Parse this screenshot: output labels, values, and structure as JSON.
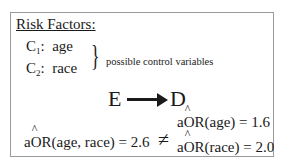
{
  "title": "Risk Factors:",
  "variables": [
    {
      "label": "C",
      "subscript": "1",
      "name": "age"
    },
    {
      "label": "C",
      "subscript": "2",
      "name": "race"
    }
  ],
  "brace_label": "possible control variables",
  "diagram": {
    "exposure": "E",
    "disease": "D"
  },
  "equations": {
    "left": {
      "prefix": "a",
      "hat_part": "O",
      "suffix": "R(age, race) = 2.6"
    },
    "operator": "≠",
    "right_top": {
      "prefix": "a",
      "hat_part": "O",
      "suffix": "R(age) = 1.6"
    },
    "right_bottom": {
      "prefix": "a",
      "hat_part": "O",
      "suffix": "R(race) = 2.0"
    }
  }
}
